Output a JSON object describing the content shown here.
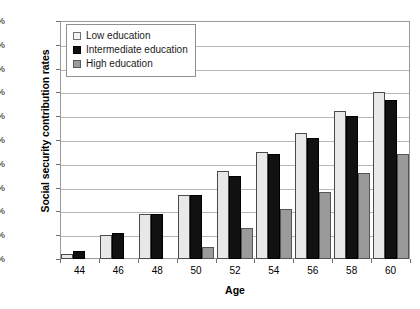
{
  "chart_data": {
    "type": "bar",
    "title": "",
    "xlabel": "Age",
    "ylabel": "Social security contribution rates",
    "categories": [
      "44",
      "46",
      "48",
      "50",
      "52",
      "54",
      "56",
      "58",
      "60"
    ],
    "series": [
      {
        "name": "Low education",
        "values": [
          2,
          10,
          19,
          27,
          37,
          45,
          53,
          62,
          70
        ]
      },
      {
        "name": "Intermediate education",
        "values": [
          3.5,
          11,
          19,
          27,
          35,
          44,
          51,
          60,
          67
        ]
      },
      {
        "name": "High education",
        "values": [
          0,
          0,
          0,
          5,
          13,
          21,
          28,
          36,
          44
        ]
      }
    ],
    "ylim": [
      0,
      100
    ],
    "y_ticks": [
      "0%",
      "10%",
      "20%",
      "30%",
      "40%",
      "50%",
      "60%",
      "70%",
      "80%",
      "90%",
      "100%"
    ],
    "y_tick_values": [
      0,
      10,
      20,
      30,
      40,
      50,
      60,
      70,
      80,
      90,
      100
    ],
    "grid": true,
    "legend_position": "top-left",
    "colors": {
      "low": "#e8e8e8",
      "intermediate": "#111111",
      "high": "#9a9a9a",
      "gridline": "#b6b6b6",
      "frame": "#9a9a9a"
    }
  },
  "axes": {
    "y_title": "Social security contribution rates",
    "x_title": "Age"
  },
  "legend": {
    "items": [
      {
        "label": "Low education"
      },
      {
        "label": "Intermediate education"
      },
      {
        "label": "High education"
      }
    ]
  }
}
